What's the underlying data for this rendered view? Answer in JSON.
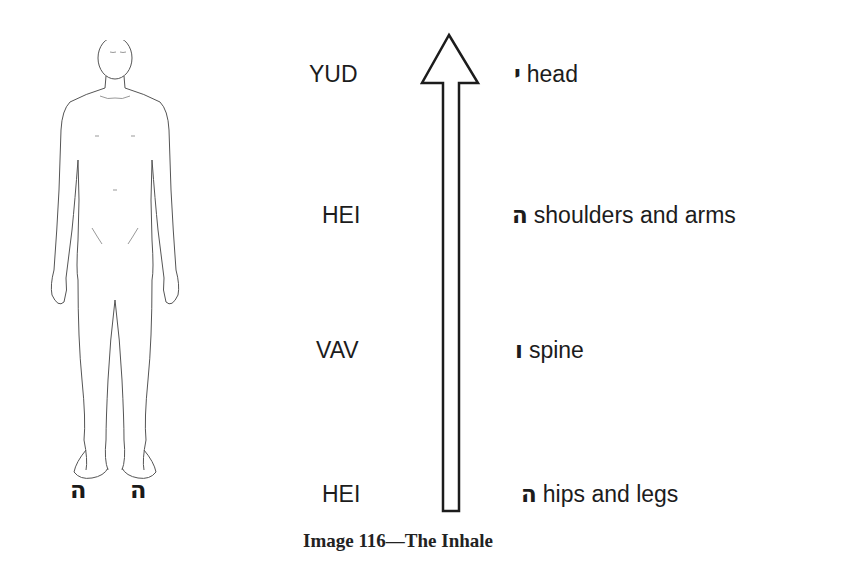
{
  "figure": {
    "caption": "Image 116—The Inhale",
    "foot_letters": [
      "ה",
      "ה"
    ],
    "levels": [
      {
        "name": "YUD",
        "letter": "י",
        "body_part": "head"
      },
      {
        "name": "HEI",
        "letter": "ה",
        "body_part": "shoulders and arms"
      },
      {
        "name": "VAV",
        "letter": "ו",
        "body_part": "spine"
      },
      {
        "name": "HEI",
        "letter": "ה",
        "body_part": "hips and legs"
      }
    ],
    "arrow_direction": "up",
    "icons": {
      "body": "human-body-outline",
      "arrow": "arrow-up-outline"
    }
  }
}
